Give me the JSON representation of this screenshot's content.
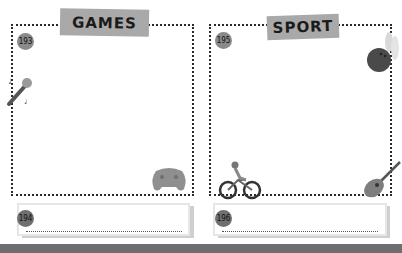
{
  "panels": [
    {
      "title": "GAMES",
      "top_badge": "193",
      "answer_badge": "194",
      "icons": [
        "microphone-icon",
        "game-controller-icon"
      ]
    },
    {
      "title": "SPORT",
      "top_badge": "195",
      "answer_badge": "196",
      "icons": [
        "bowling-icon",
        "cyclist-icon",
        "guitar-icon"
      ]
    }
  ],
  "colors": {
    "banner": "#a9a9a9",
    "badge": "#808080",
    "frame_dots": "#2a2a2a",
    "bottom_bar": "#6e6e6e"
  }
}
